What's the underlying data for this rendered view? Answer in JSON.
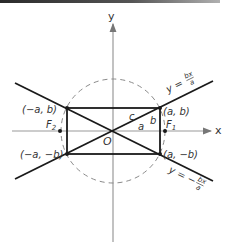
{
  "figure": {
    "type": "hyperbola-asymptote-construction",
    "colors": {
      "ink": "#1a1a1a",
      "axis": "#888888",
      "dashed_circle": "#888888",
      "label": "#333333",
      "top_bar": "#2a2a2a"
    },
    "axes": {
      "x_label": "x",
      "y_label": "y",
      "origin_label": "O"
    },
    "points": {
      "top_right": "(a, b)",
      "top_left": "(−a, b)",
      "bottom_right": "(a, −b)",
      "bottom_left": "(−a, −b)"
    },
    "foci": {
      "f1": "F",
      "f1_sub": "1",
      "f2": "F",
      "f2_sub": "2"
    },
    "segments": {
      "hypotenuse": "c",
      "horizontal": "a",
      "vertical": "b"
    },
    "asymptotes": {
      "positive": {
        "prefix": "y =",
        "num": "bx",
        "den": "a"
      },
      "negative": {
        "prefix": "y = −",
        "num": "bx",
        "den": "a"
      }
    }
  }
}
